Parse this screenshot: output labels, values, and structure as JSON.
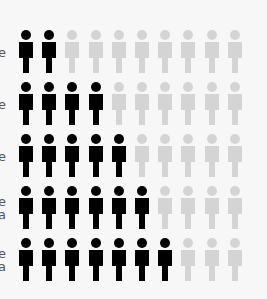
{
  "chart_data": {
    "type": "pictograph",
    "title": "",
    "icon": "person-icon",
    "icons_per_row": 10,
    "colors": {
      "filled": "#000000",
      "empty": "#d4d4d4"
    },
    "rows": [
      {
        "label_visible": [
          "e"
        ],
        "filled": 2,
        "total": 10
      },
      {
        "label_visible": [
          "e"
        ],
        "filled": 4,
        "total": 10
      },
      {
        "label_visible": [
          "e"
        ],
        "filled": 5,
        "total": 10
      },
      {
        "label_visible": [
          "e",
          "a"
        ],
        "filled": 6,
        "total": 10
      },
      {
        "label_visible": [
          "e",
          "a"
        ],
        "filled": 7,
        "total": 10
      }
    ],
    "values": [
      2,
      4,
      5,
      6,
      7
    ]
  },
  "layout": {
    "row_tops": [
      30,
      82,
      134,
      186,
      238
    ],
    "icon_pitch": 23.2
  }
}
